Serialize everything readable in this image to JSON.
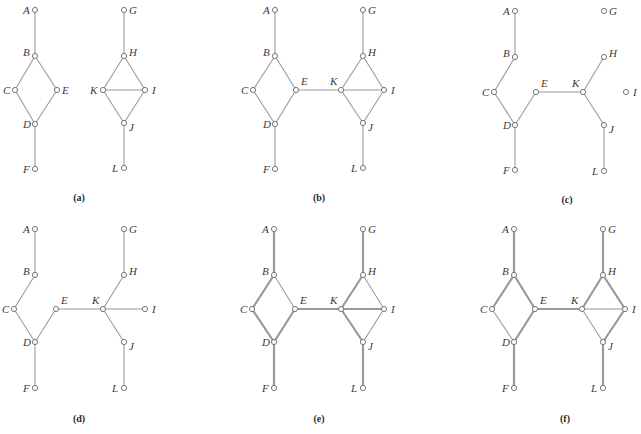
{
  "figure": {
    "style": {
      "edge_color": "#9a9a9a",
      "thin_width": 1.1,
      "thick_width": 2.2,
      "node_radius": 2.6,
      "node_fill": "#ffffff",
      "node_stroke": "#6a6a6a",
      "label_color": "#3a3a3a"
    },
    "panels": [
      {
        "id": "a",
        "caption": "(a)",
        "caption_pos": [
          79,
          201
        ],
        "nodes": {
          "A": {
            "x": 35,
            "y": 10,
            "label": "A",
            "lx": -12,
            "ly": 4
          },
          "B": {
            "x": 35,
            "y": 56,
            "label": "B",
            "lx": -12,
            "ly": 0
          },
          "C": {
            "x": 15,
            "y": 90,
            "label": "C",
            "lx": -12,
            "ly": 4
          },
          "E": {
            "x": 57,
            "y": 90,
            "label": "E",
            "lx": 5,
            "ly": 4
          },
          "D": {
            "x": 35,
            "y": 124,
            "label": "D",
            "lx": -12,
            "ly": 4
          },
          "F": {
            "x": 35,
            "y": 169,
            "label": "F",
            "lx": -12,
            "ly": 4
          },
          "G": {
            "x": 124,
            "y": 10,
            "label": "G",
            "lx": 5,
            "ly": 4
          },
          "H": {
            "x": 124,
            "y": 56,
            "label": "H",
            "lx": 5,
            "ly": 0
          },
          "K": {
            "x": 103,
            "y": 90,
            "label": "K",
            "lx": -13,
            "ly": 4
          },
          "I": {
            "x": 145,
            "y": 90,
            "label": "I",
            "lx": 7,
            "ly": 4
          },
          "J": {
            "x": 124,
            "y": 123,
            "label": "J",
            "lx": 5,
            "ly": 8
          },
          "L": {
            "x": 124,
            "y": 168,
            "label": "L",
            "lx": -12,
            "ly": 4
          }
        },
        "edges": [
          [
            "A",
            "B",
            "thin"
          ],
          [
            "B",
            "C",
            "thin"
          ],
          [
            "B",
            "E",
            "thin"
          ],
          [
            "C",
            "D",
            "thin"
          ],
          [
            "E",
            "D",
            "thin"
          ],
          [
            "D",
            "F",
            "thin"
          ],
          [
            "G",
            "H",
            "thin"
          ],
          [
            "H",
            "K",
            "thin"
          ],
          [
            "H",
            "I",
            "thin"
          ],
          [
            "K",
            "I",
            "thin"
          ],
          [
            "K",
            "J",
            "thin"
          ],
          [
            "I",
            "J",
            "thin"
          ],
          [
            "J",
            "L",
            "thin"
          ]
        ]
      },
      {
        "id": "b",
        "caption": "(b)",
        "caption_pos": [
          319,
          201
        ],
        "nodes": {
          "A": {
            "x": 275,
            "y": 10,
            "label": "A",
            "lx": -12,
            "ly": 4
          },
          "B": {
            "x": 275,
            "y": 56,
            "label": "B",
            "lx": -12,
            "ly": 0
          },
          "C": {
            "x": 253,
            "y": 90,
            "label": "C",
            "lx": -12,
            "ly": 4
          },
          "E": {
            "x": 296,
            "y": 90,
            "label": "E",
            "lx": 5,
            "ly": -5
          },
          "D": {
            "x": 275,
            "y": 124,
            "label": "D",
            "lx": -12,
            "ly": 4
          },
          "F": {
            "x": 275,
            "y": 169,
            "label": "F",
            "lx": -12,
            "ly": 4
          },
          "G": {
            "x": 363,
            "y": 10,
            "label": "G",
            "lx": 5,
            "ly": 4
          },
          "H": {
            "x": 363,
            "y": 56,
            "label": "H",
            "lx": 5,
            "ly": 0
          },
          "K": {
            "x": 341,
            "y": 90,
            "label": "K",
            "lx": -11,
            "ly": -5
          },
          "I": {
            "x": 384,
            "y": 90,
            "label": "I",
            "lx": 7,
            "ly": 4
          },
          "J": {
            "x": 363,
            "y": 123,
            "label": "J",
            "lx": 5,
            "ly": 8
          },
          "L": {
            "x": 363,
            "y": 168,
            "label": "L",
            "lx": -12,
            "ly": 4
          }
        },
        "edges": [
          [
            "A",
            "B",
            "thin"
          ],
          [
            "B",
            "C",
            "thin"
          ],
          [
            "B",
            "E",
            "thin"
          ],
          [
            "C",
            "D",
            "thin"
          ],
          [
            "E",
            "D",
            "thin"
          ],
          [
            "D",
            "F",
            "thin"
          ],
          [
            "E",
            "K",
            "thin"
          ],
          [
            "G",
            "H",
            "thin"
          ],
          [
            "H",
            "K",
            "thin"
          ],
          [
            "H",
            "I",
            "thin"
          ],
          [
            "K",
            "I",
            "thin"
          ],
          [
            "K",
            "J",
            "thin"
          ],
          [
            "I",
            "J",
            "thin"
          ],
          [
            "J",
            "L",
            "thin"
          ]
        ]
      },
      {
        "id": "c",
        "caption": "(c)",
        "caption_pos": [
          567,
          203
        ],
        "nodes": {
          "A": {
            "x": 515,
            "y": 11,
            "label": "A",
            "lx": -12,
            "ly": 4
          },
          "B": {
            "x": 515,
            "y": 57,
            "label": "B",
            "lx": -12,
            "ly": 0
          },
          "C": {
            "x": 494,
            "y": 92,
            "label": "C",
            "lx": -12,
            "ly": 4
          },
          "E": {
            "x": 536,
            "y": 92,
            "label": "E",
            "lx": 5,
            "ly": -5
          },
          "D": {
            "x": 515,
            "y": 125,
            "label": "D",
            "lx": -12,
            "ly": 4
          },
          "F": {
            "x": 515,
            "y": 170,
            "label": "F",
            "lx": -12,
            "ly": 4
          },
          "G": {
            "x": 604,
            "y": 11,
            "label": "G",
            "lx": 5,
            "ly": 4
          },
          "H": {
            "x": 604,
            "y": 57,
            "label": "H",
            "lx": 5,
            "ly": 0
          },
          "K": {
            "x": 583,
            "y": 92,
            "label": "K",
            "lx": -11,
            "ly": -5
          },
          "I": {
            "x": 626,
            "y": 92,
            "label": "I",
            "lx": 7,
            "ly": 4
          },
          "J": {
            "x": 604,
            "y": 125,
            "label": "J",
            "lx": 5,
            "ly": 8
          },
          "L": {
            "x": 604,
            "y": 171,
            "label": "L",
            "lx": -12,
            "ly": 4
          }
        },
        "edges": [
          [
            "A",
            "B",
            "thin"
          ],
          [
            "B",
            "C",
            "thin"
          ],
          [
            "C",
            "D",
            "thin"
          ],
          [
            "D",
            "E",
            "thin"
          ],
          [
            "D",
            "F",
            "thin"
          ],
          [
            "E",
            "K",
            "thin"
          ],
          [
            "K",
            "H",
            "thin"
          ],
          [
            "K",
            "J",
            "thin"
          ],
          [
            "J",
            "L",
            "thin"
          ]
        ]
      },
      {
        "id": "d",
        "caption": "(d)",
        "caption_pos": [
          79,
          422
        ],
        "nodes": {
          "A": {
            "x": 35,
            "y": 229,
            "label": "A",
            "lx": -12,
            "ly": 4
          },
          "B": {
            "x": 35,
            "y": 275,
            "label": "B",
            "lx": -12,
            "ly": 0
          },
          "C": {
            "x": 14,
            "y": 309,
            "label": "C",
            "lx": -12,
            "ly": 4
          },
          "E": {
            "x": 56,
            "y": 309,
            "label": "E",
            "lx": 5,
            "ly": -5
          },
          "D": {
            "x": 35,
            "y": 342,
            "label": "D",
            "lx": -12,
            "ly": 4
          },
          "F": {
            "x": 35,
            "y": 388,
            "label": "F",
            "lx": -12,
            "ly": 4
          },
          "G": {
            "x": 124,
            "y": 229,
            "label": "G",
            "lx": 5,
            "ly": 4
          },
          "H": {
            "x": 124,
            "y": 275,
            "label": "H",
            "lx": 5,
            "ly": 0
          },
          "K": {
            "x": 103,
            "y": 309,
            "label": "K",
            "lx": -11,
            "ly": -5
          },
          "I": {
            "x": 145,
            "y": 309,
            "label": "I",
            "lx": 7,
            "ly": 4
          },
          "J": {
            "x": 124,
            "y": 342,
            "label": "J",
            "lx": 5,
            "ly": 8
          },
          "L": {
            "x": 124,
            "y": 388,
            "label": "L",
            "lx": -12,
            "ly": 4
          }
        },
        "edges": [
          [
            "A",
            "B",
            "thin"
          ],
          [
            "B",
            "C",
            "thin"
          ],
          [
            "C",
            "D",
            "thin"
          ],
          [
            "D",
            "E",
            "thin"
          ],
          [
            "D",
            "F",
            "thin"
          ],
          [
            "E",
            "K",
            "thin"
          ],
          [
            "G",
            "H",
            "thin"
          ],
          [
            "H",
            "K",
            "thin"
          ],
          [
            "K",
            "I",
            "thin"
          ],
          [
            "K",
            "J",
            "thin"
          ],
          [
            "J",
            "L",
            "thin"
          ]
        ]
      },
      {
        "id": "e",
        "caption": "(e)",
        "caption_pos": [
          319,
          422
        ],
        "nodes": {
          "A": {
            "x": 274,
            "y": 229,
            "label": "A",
            "lx": -12,
            "ly": 4
          },
          "B": {
            "x": 274,
            "y": 275,
            "label": "B",
            "lx": -12,
            "ly": 0
          },
          "C": {
            "x": 252,
            "y": 309,
            "label": "C",
            "lx": -12,
            "ly": 4
          },
          "E": {
            "x": 295,
            "y": 309,
            "label": "E",
            "lx": 5,
            "ly": -5
          },
          "D": {
            "x": 274,
            "y": 342,
            "label": "D",
            "lx": -12,
            "ly": 4
          },
          "F": {
            "x": 274,
            "y": 388,
            "label": "F",
            "lx": -12,
            "ly": 4
          },
          "G": {
            "x": 363,
            "y": 229,
            "label": "G",
            "lx": 5,
            "ly": 4
          },
          "H": {
            "x": 363,
            "y": 275,
            "label": "H",
            "lx": 5,
            "ly": 0
          },
          "K": {
            "x": 341,
            "y": 309,
            "label": "K",
            "lx": -11,
            "ly": -5
          },
          "I": {
            "x": 384,
            "y": 309,
            "label": "I",
            "lx": 7,
            "ly": 4
          },
          "J": {
            "x": 363,
            "y": 342,
            "label": "J",
            "lx": 5,
            "ly": 8
          },
          "L": {
            "x": 363,
            "y": 388,
            "label": "L",
            "lx": -12,
            "ly": 4
          }
        },
        "edges": [
          [
            "A",
            "B",
            "thick"
          ],
          [
            "B",
            "C",
            "thick"
          ],
          [
            "B",
            "E",
            "thin"
          ],
          [
            "C",
            "D",
            "thick"
          ],
          [
            "D",
            "E",
            "thick"
          ],
          [
            "D",
            "F",
            "thick"
          ],
          [
            "E",
            "K",
            "thick"
          ],
          [
            "G",
            "H",
            "thick"
          ],
          [
            "H",
            "K",
            "thick"
          ],
          [
            "H",
            "I",
            "thin"
          ],
          [
            "K",
            "I",
            "thick"
          ],
          [
            "K",
            "J",
            "thick"
          ],
          [
            "I",
            "J",
            "thin"
          ],
          [
            "J",
            "L",
            "thick"
          ]
        ]
      },
      {
        "id": "f",
        "caption": "(f)",
        "caption_pos": [
          565,
          422
        ],
        "nodes": {
          "A": {
            "x": 514,
            "y": 229,
            "label": "A",
            "lx": -12,
            "ly": 4
          },
          "B": {
            "x": 514,
            "y": 275,
            "label": "B",
            "lx": -12,
            "ly": 0
          },
          "C": {
            "x": 492,
            "y": 309,
            "label": "C",
            "lx": -12,
            "ly": 4
          },
          "E": {
            "x": 535,
            "y": 309,
            "label": "E",
            "lx": 5,
            "ly": -5
          },
          "D": {
            "x": 514,
            "y": 342,
            "label": "D",
            "lx": -12,
            "ly": 4
          },
          "F": {
            "x": 514,
            "y": 388,
            "label": "F",
            "lx": -12,
            "ly": 4
          },
          "G": {
            "x": 603,
            "y": 229,
            "label": "G",
            "lx": 5,
            "ly": 4
          },
          "H": {
            "x": 603,
            "y": 275,
            "label": "H",
            "lx": 5,
            "ly": 0
          },
          "K": {
            "x": 582,
            "y": 309,
            "label": "K",
            "lx": -11,
            "ly": -5
          },
          "I": {
            "x": 625,
            "y": 309,
            "label": "I",
            "lx": 7,
            "ly": 4
          },
          "J": {
            "x": 603,
            "y": 342,
            "label": "J",
            "lx": 5,
            "ly": 8
          },
          "L": {
            "x": 603,
            "y": 388,
            "label": "L",
            "lx": -12,
            "ly": 4
          }
        },
        "edges": [
          [
            "A",
            "B",
            "thick"
          ],
          [
            "B",
            "C",
            "thick"
          ],
          [
            "B",
            "E",
            "thick"
          ],
          [
            "C",
            "D",
            "thin"
          ],
          [
            "D",
            "E",
            "thick"
          ],
          [
            "D",
            "F",
            "thick"
          ],
          [
            "E",
            "K",
            "thick"
          ],
          [
            "G",
            "H",
            "thick"
          ],
          [
            "H",
            "K",
            "thick"
          ],
          [
            "H",
            "I",
            "thick"
          ],
          [
            "K",
            "I",
            "thin"
          ],
          [
            "K",
            "J",
            "thin"
          ],
          [
            "I",
            "J",
            "thick"
          ],
          [
            "J",
            "L",
            "thick"
          ]
        ]
      }
    ]
  }
}
